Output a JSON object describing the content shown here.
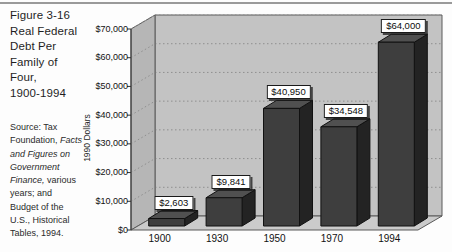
{
  "figure": {
    "title_lines": [
      "Figure 3-16",
      "Real Federal",
      "Debt Per",
      "Family of",
      "Four,",
      "1900-1994"
    ],
    "source_lines": [
      [
        {
          "t": "Source: Tax",
          "i": 0
        }
      ],
      [
        {
          "t": "Foundation, ",
          "i": 0
        },
        {
          "t": "Facts",
          "i": 1
        }
      ],
      [
        {
          "t": "and Figures on",
          "i": 1
        }
      ],
      [
        {
          "t": "Government",
          "i": 1
        }
      ],
      [
        {
          "t": "Finance,",
          "i": 1
        },
        {
          "t": " various",
          "i": 0
        }
      ],
      [
        {
          "t": "years; and",
          "i": 0
        }
      ],
      [
        {
          "t": "Budget of the",
          "i": 0
        }
      ],
      [
        {
          "t": "U.S., Historical",
          "i": 0
        }
      ],
      [
        {
          "t": "Tables, 1994.",
          "i": 0
        }
      ]
    ]
  },
  "chart_data": {
    "type": "bar",
    "style": "3d-column",
    "categories": [
      "1900",
      "1930",
      "1950",
      "1970",
      "1994"
    ],
    "values": [
      2603,
      9841,
      40950,
      34548,
      64000
    ],
    "value_labels": [
      "$2,603",
      "$9,841",
      "$40,950",
      "$34,548",
      "$64,000"
    ],
    "xlabel": "",
    "ylabel": "1990 Dollars",
    "ylim": [
      0,
      70000
    ],
    "ytick_step": 10000,
    "ytick_labels": [
      "$0",
      "$10,000",
      "$20,000",
      "$30,000",
      "$40,000",
      "$50,000",
      "$60,000",
      "$70,000"
    ],
    "grid": true,
    "gridline_style": "dotted",
    "legend": "none",
    "colors": {
      "bar_front": "#3e3e3e",
      "bar_side": "#232323",
      "bar_top": "#505050",
      "back_wall": "#c3c3c3",
      "side_wall": "#b6b6b6",
      "floor": "#cbcbcb",
      "gridline": "#8f8f8f",
      "outline": "#5a5a5a",
      "axis": "#333333",
      "label_box_bg": "#ffffff",
      "label_box_border": "#1a1a1a"
    }
  }
}
